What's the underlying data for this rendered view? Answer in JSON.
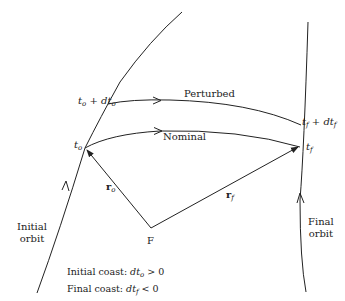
{
  "diagram": {
    "curves": {
      "initial_orbit_label": [
        "Initial",
        "orbit"
      ],
      "final_orbit_label": [
        "Final",
        "orbit"
      ],
      "perturbed_label": "Perturbed",
      "nominal_label": "Nominal"
    },
    "points": {
      "focus": "F",
      "t_o": {
        "base": "t",
        "sub": "o"
      },
      "t_o_dt": {
        "base": "t",
        "sub": "o",
        "plus": " + ",
        "dt": "dt",
        "dt_sub": "o"
      },
      "t_f": {
        "base": "t",
        "sub": "f"
      },
      "t_f_dt": {
        "base": "t",
        "sub": "f",
        "plus": " + ",
        "dt": "dt",
        "dt_sub": "f"
      }
    },
    "vectors": {
      "r_o": {
        "base": "r",
        "sub": "o"
      },
      "r_f": {
        "base": "r",
        "sub": "f"
      }
    },
    "caption": {
      "line1": {
        "prefix": "Initial coast: ",
        "var": "dt",
        "sub": "o",
        "rel": " > 0"
      },
      "line2": {
        "prefix": "Final coast: ",
        "var": "dt",
        "sub": "f",
        "rel": " < 0"
      }
    },
    "colors": {
      "stroke": "#222222",
      "background": "#ffffff"
    }
  }
}
